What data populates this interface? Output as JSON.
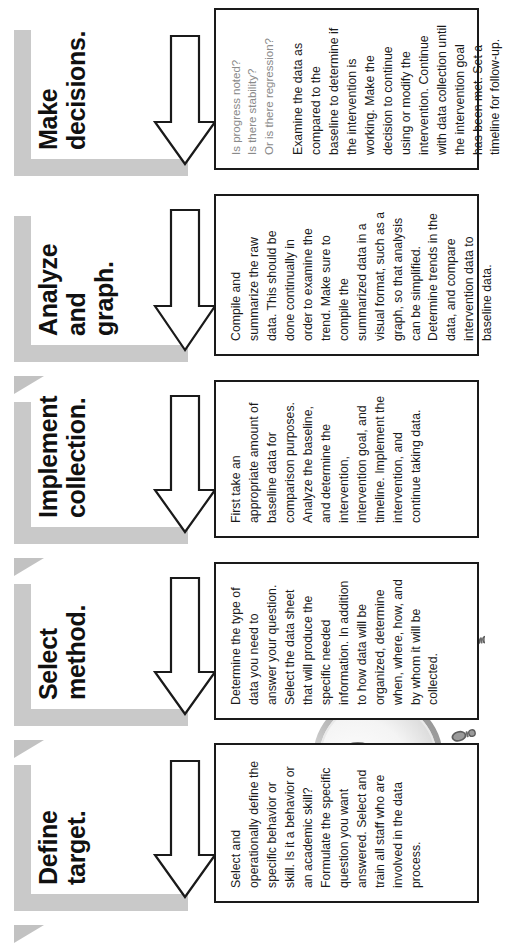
{
  "document": {
    "type": "process-flowchart",
    "orientation": "rotated-90-ccw",
    "colors": {
      "ribbon_gray": "#c9c9c9",
      "ribbon_fold_gray": "#c2c2c2",
      "box_border": "#1a1a1a",
      "body_text": "#1a1a1a",
      "question_text": "#8a8a8a",
      "page_background": "#ffffff"
    }
  },
  "illustration": {
    "name": "magnifying-glass-over-footprints",
    "lens_label": "magnified-shoe-print",
    "footprint_count": 7
  },
  "steps": [
    {
      "id": "define-target",
      "heading": "Define\ntarget.",
      "questions": "",
      "body": "Select and operationally define the specific behavior or skill. Is it a behavior or an academic skill? Formulate the specific question you want answered. Select and train all staff who are involved in the data process."
    },
    {
      "id": "select-method",
      "heading": "Select\nmethod.",
      "questions": "",
      "body": "Determine the type of data you need to answer your question. Select the data sheet that will produce the specific needed information. In addition to how data will be organized, determine when, where, how, and by whom it will be collected."
    },
    {
      "id": "implement-collection",
      "heading": "Implement\ncollection.",
      "questions": "",
      "body": "First take an appropriate amount of baseline data for comparison purposes. Analyze the baseline, and determine the intervention, intervention goal, and timeline. Implement the intervention, and continue taking data."
    },
    {
      "id": "analyze-and-graph",
      "heading": "Analyze and\ngraph.",
      "questions": "",
      "body": "Compile and summarize the raw data. This should be done continually in order to examine the trend. Make sure to compile the summarized data in a visual format, such as a graph, so that analysis can be simplified. Determine trends in the data, and compare intervention data to baseline data."
    },
    {
      "id": "make-decisions",
      "heading": "Make\ndecisions.",
      "questions": "Is progress noted?\nIs there stability?\nOr is there regression?",
      "body": "Examine the data as compared to the baseline to determine if the intervention is working. Make the decision to continue using or modify the intervention. Continue with data collection until the intervention goal has been met. Set a timeline for follow-up."
    }
  ]
}
